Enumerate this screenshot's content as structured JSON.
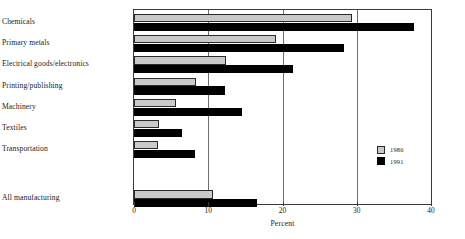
{
  "chart_data": {
    "type": "bar",
    "orientation": "horizontal",
    "title": "",
    "subtitle": "",
    "xlabel": "Percent",
    "ylabel": "",
    "xlim": [
      0,
      40
    ],
    "xticks": [
      0,
      10,
      20,
      30,
      40
    ],
    "xtick_labels": [
      "0",
      "10",
      "20",
      "30",
      "40"
    ],
    "grid": true,
    "grid_axis": "x",
    "legend_position": "inside-right",
    "categories": [
      "Chemicals",
      "Primary metals",
      "Electrical goods/electronics",
      "Printing/publishing",
      "Machinery",
      "Textiles",
      "Transportation",
      "All manufacturing"
    ],
    "series": [
      {
        "name": "1986",
        "color": "#c9c9c9",
        "values": [
          29.3,
          19.1,
          12.4,
          8.4,
          5.6,
          3.4,
          3.2,
          10.7
        ]
      },
      {
        "name": "1991",
        "color": "#000000",
        "values": [
          37.7,
          28.3,
          21.4,
          12.2,
          14.6,
          6.5,
          8.2,
          16.6
        ]
      }
    ]
  },
  "legend": {
    "entries": [
      {
        "label": "1986",
        "swatch": "light-gray-square"
      },
      {
        "label": "1991",
        "swatch": "black-square"
      }
    ]
  },
  "axis": {
    "x_title": "Percent"
  }
}
